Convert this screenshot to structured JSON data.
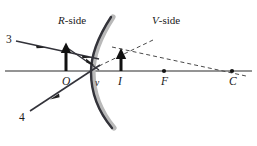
{
  "figure": {
    "width": 257,
    "height": 146,
    "background": "#ffffff"
  },
  "labels": {
    "r_side_italic": "R",
    "r_side_rest": "-side",
    "v_side_italic": "V",
    "v_side_rest": "-side",
    "object": "O",
    "vertex": "v",
    "image": "I",
    "focus": "F",
    "center": "C",
    "ray3": "3",
    "ray4": "4"
  },
  "colors": {
    "ink": "#1a1a1a",
    "axis": "#2b2b2b",
    "ray": "#3a3a3a",
    "dashed": "#555555",
    "mirror_dark": "#2e2e2e",
    "mirror_shadow": "#b5b5b5",
    "arrow_fill": "#111111"
  },
  "geometry": {
    "axis_y": 71,
    "axis_x_start": 5,
    "axis_x_end": 252,
    "vertex": {
      "x": 96,
      "y": 71
    },
    "object_base": {
      "x": 66,
      "y": 71
    },
    "object_tip": {
      "x": 66,
      "y": 45
    },
    "image_base": {
      "x": 121,
      "y": 71
    },
    "image_tip": {
      "x": 121,
      "y": 53
    },
    "focus": {
      "x": 164,
      "y": 71
    },
    "center": {
      "x": 232,
      "y": 71
    },
    "ray3_start": {
      "x": 18,
      "y": 41
    },
    "ray3_end": {
      "x": 102,
      "y": 58
    },
    "ray4_start": {
      "x": 31,
      "y": 110
    },
    "ray4_end": {
      "x": 101,
      "y": 64
    },
    "mirror_top": {
      "x": 110,
      "y": 17
    },
    "mirror_bottom": {
      "x": 110,
      "y": 127
    },
    "mirror_bulge": {
      "x": 92,
      "y": 72
    }
  },
  "points": [
    {
      "name": "focus-point",
      "label": "F",
      "x": 164,
      "y": 71
    },
    {
      "name": "center-point",
      "label": "C",
      "x": 232,
      "y": 71
    }
  ],
  "rays": [
    {
      "name": "incident-ray-3",
      "label": "3",
      "style": "solid",
      "direction": "leftward-arrowhead"
    },
    {
      "name": "incident-ray-4",
      "label": "4",
      "style": "solid",
      "direction": "down-left-arrowhead"
    },
    {
      "name": "virtual-ray-extension-upper",
      "style": "dashed"
    },
    {
      "name": "virtual-ray-extension-to-center",
      "style": "dashed"
    }
  ]
}
